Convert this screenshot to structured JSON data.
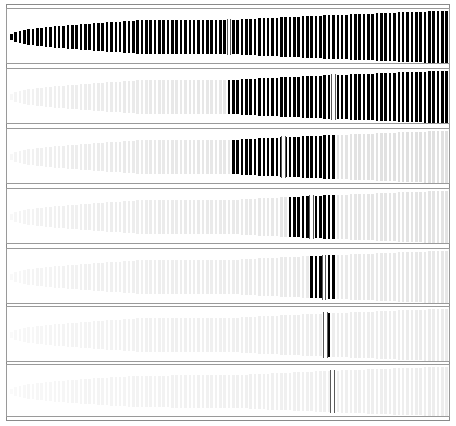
{
  "figure": {
    "title": "Contrast sensitivity bar panels",
    "width": 456,
    "height": 426,
    "background": "#ffffff",
    "frame": {
      "x": 6,
      "y": 4,
      "width": 444,
      "height": 417,
      "border_color": "#8a8a8a",
      "border_width": 1
    },
    "panel_border_color": "#9a9a9a",
    "bar_color_dark": "#000000",
    "bar_color_light": "#d9d9d9",
    "marker_color": "#5a5a5a",
    "marker_fill": "#ffffff"
  },
  "chart_data": {
    "type": "bar",
    "title": "Contrast sensitivity bar panels",
    "subtitle": "Seven stacked panels of constant-frequency vertical bars with a log-increasing height envelope; the high-contrast (black) band narrows from panel 1 to panel 7",
    "xlabel": "",
    "ylabel": "",
    "grid": false,
    "legend": "none",
    "xlim": [
      0,
      444
    ],
    "ylim": [
      -1,
      1
    ],
    "bar_period_px": 4.35,
    "bar_width_px": 2.6,
    "n_bars_per_panel": 101,
    "envelope": {
      "description": "Half-height of each bar grows log-linearly from left to right, with a gentle mid plateau",
      "start_half_height_frac": 0.055,
      "end_half_height_frac": 0.47,
      "mid_plateau_start_frac": 0.3,
      "mid_plateau_end_frac": 0.5,
      "mid_plateau_half_height_frac": 0.3
    },
    "panels": [
      {
        "index": 1,
        "label": "panel-1",
        "y": 8,
        "height": 56,
        "dark_start_frac": 0.0,
        "dark_end_frac": 1.0,
        "light_contrast": 1.0,
        "marker_frac": 0.5,
        "marker_visible": true,
        "note": "Entire row rendered at full contrast (black) across all bars"
      },
      {
        "index": 2,
        "label": "panel-2",
        "y": 68,
        "height": 56,
        "dark_start_frac": 0.5,
        "dark_end_frac": 1.0,
        "light_contrast": 0.16,
        "marker_frac": 0.74,
        "marker_visible": true,
        "note": "Black from the midpoint rightwards; left half faint grey"
      },
      {
        "index": 3,
        "label": "panel-3",
        "y": 128,
        "height": 56,
        "dark_start_frac": 0.505,
        "dark_end_frac": 0.745,
        "light_contrast": 0.16,
        "marker_frac": 0.625,
        "marker_visible": true,
        "note": "Black band spans the central-right quarter"
      },
      {
        "index": 4,
        "label": "panel-4",
        "y": 188,
        "height": 56,
        "dark_start_frac": 0.635,
        "dark_end_frac": 0.745,
        "light_contrast": 0.14,
        "marker_frac": 0.69,
        "marker_visible": true,
        "note": "Narrower black band"
      },
      {
        "index": 5,
        "label": "panel-5",
        "y": 248,
        "height": 56,
        "dark_start_frac": 0.69,
        "dark_end_frac": 0.745,
        "light_contrast": 0.12,
        "marker_frac": 0.718,
        "marker_visible": true,
        "note": "Very narrow black band, a handful of bars"
      },
      {
        "index": 6,
        "label": "panel-6",
        "y": 306,
        "height": 56,
        "dark_start_frac": 0.713,
        "dark_end_frac": 0.733,
        "light_contrast": 0.1,
        "marker_frac": 0.722,
        "marker_visible": true,
        "note": "Only about two black bars remain"
      },
      {
        "index": 7,
        "label": "panel-7",
        "y": 364,
        "height": 53,
        "dark_start_frac": 0.0,
        "dark_end_frac": 0.0,
        "light_contrast": 0.09,
        "marker_frac": 0.738,
        "marker_visible": true,
        "note": "No black bars; only the outlined marker box remains"
      }
    ]
  }
}
